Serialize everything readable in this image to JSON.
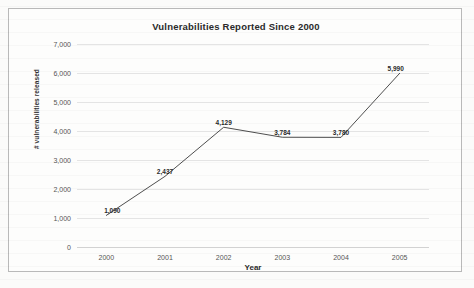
{
  "document": {
    "kind": "scanned-chart-figure",
    "frame_border_color": "#b9b9b9",
    "page_background": "#fbfbfa"
  },
  "chart_data": {
    "type": "line",
    "title": "Vulnerabilities Reported Since 2000",
    "xlabel": "Year",
    "ylabel": "# vulnerabilities released",
    "categories": [
      "2000",
      "2001",
      "2002",
      "2003",
      "2004",
      "2005"
    ],
    "values": [
      1090,
      2437,
      4129,
      3784,
      3780,
      5990
    ],
    "data_labels": [
      "1,090",
      "2,437",
      "4,129",
      "3,784",
      "3,780",
      "5,990"
    ],
    "ylim": [
      0,
      7000
    ],
    "ytick_values": [
      0,
      1000,
      2000,
      3000,
      4000,
      5000,
      6000,
      7000
    ],
    "ytick_labels": [
      "0",
      "1,000",
      "2,000",
      "3,000",
      "4,000",
      "5,000",
      "6,000",
      "7,000"
    ],
    "grid": true,
    "grid_axis": "y",
    "grid_color": "#e4e4e4",
    "legend": false,
    "legend_position": "none",
    "series": [
      {
        "name": "# vulnerabilities released",
        "values": [
          1090,
          2437,
          4129,
          3784,
          3780,
          5990
        ],
        "line_color": "#3a3a3a",
        "marker": "none"
      }
    ]
  }
}
